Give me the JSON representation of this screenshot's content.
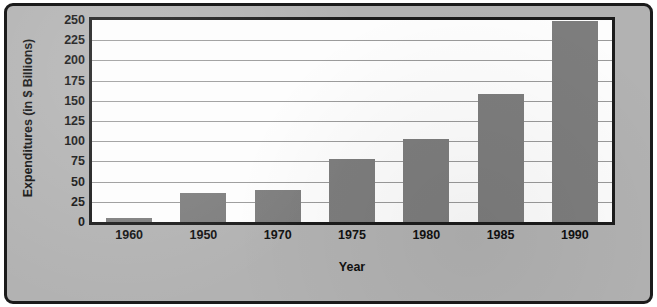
{
  "chart_data": {
    "type": "bar",
    "title": "",
    "xlabel": "Year",
    "ylabel": "Expenditures (in $ Billions)",
    "categories": [
      "1960",
      "1950",
      "1970",
      "1975",
      "1980",
      "1985",
      "1990"
    ],
    "values": [
      5,
      36,
      40,
      78,
      103,
      158,
      249
    ],
    "ylim": [
      0,
      250
    ],
    "yticks": [
      0,
      25,
      50,
      75,
      100,
      125,
      150,
      175,
      200,
      225,
      250
    ],
    "ytick_labels": [
      "0",
      "25",
      "50",
      "75",
      "100",
      "125",
      "150",
      "175",
      "200",
      "225",
      "250"
    ],
    "grid": true,
    "legend": false,
    "bar_color": "#7d7d7d",
    "plot_background": "#fdfdfd",
    "frame_color": "#1b1b1b",
    "page_background": "#b2b2b2",
    "gridline_color": "#9a9a9a"
  }
}
